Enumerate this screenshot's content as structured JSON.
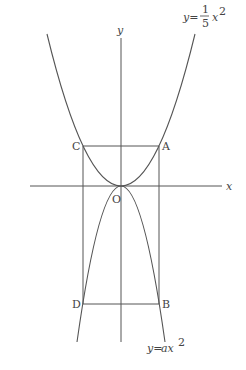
{
  "diagram": {
    "type": "coordinate-graph",
    "axes": {
      "x_label": "x",
      "y_label": "y",
      "origin_label": "O"
    },
    "curves": [
      {
        "name": "upper-parabola",
        "label_prefix": "y=",
        "label_num": "1",
        "label_den": "5",
        "label_suffix": "x",
        "label_exp": "2",
        "equation": "y = 1/5 x^2"
      },
      {
        "name": "lower-parabola",
        "label_prefix": "y=",
        "label_mid": "ax",
        "label_exp": "2",
        "equation": "y = ax^2"
      }
    ],
    "points": {
      "A": "A",
      "B": "B",
      "C": "C",
      "D": "D",
      "O": "O"
    }
  }
}
